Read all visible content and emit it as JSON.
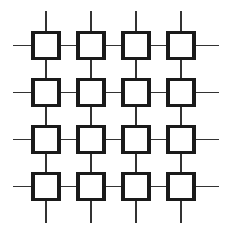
{
  "figure": {
    "canvas": {
      "width": 234,
      "height": 236,
      "background": "#ffffff"
    },
    "style": {
      "node_fill": "#ffffff",
      "node_stroke": "#1a1a1a",
      "node_stroke_width": 3.2,
      "line_stroke": "#333333",
      "line_stroke_width": 1.6
    },
    "grid": {
      "rows": 4,
      "columns": 4,
      "node_count": 16,
      "node_size": 26,
      "column_centers": [
        46,
        91,
        136,
        181
      ],
      "row_centers": [
        45.5,
        92.5,
        139.5,
        186.5
      ],
      "column_pitch": 45,
      "row_pitch": 47
    },
    "stubs": {
      "left_x": 13,
      "right_x": 219,
      "top_y": 11,
      "bottom_y": 223
    },
    "nodes": [
      {
        "id": "node-r1c1",
        "row": 1,
        "col": 1,
        "cx": 46,
        "cy": 45.5
      },
      {
        "id": "node-r1c2",
        "row": 1,
        "col": 2,
        "cx": 91,
        "cy": 45.5
      },
      {
        "id": "node-r1c3",
        "row": 1,
        "col": 3,
        "cx": 136,
        "cy": 45.5
      },
      {
        "id": "node-r1c4",
        "row": 1,
        "col": 4,
        "cx": 181,
        "cy": 45.5
      },
      {
        "id": "node-r2c1",
        "row": 2,
        "col": 1,
        "cx": 46,
        "cy": 92.5
      },
      {
        "id": "node-r2c2",
        "row": 2,
        "col": 2,
        "cx": 91,
        "cy": 92.5
      },
      {
        "id": "node-r2c3",
        "row": 2,
        "col": 3,
        "cx": 136,
        "cy": 92.5
      },
      {
        "id": "node-r2c4",
        "row": 2,
        "col": 4,
        "cx": 181,
        "cy": 92.5
      },
      {
        "id": "node-r3c1",
        "row": 3,
        "col": 1,
        "cx": 46,
        "cy": 139.5
      },
      {
        "id": "node-r3c2",
        "row": 3,
        "col": 2,
        "cx": 91,
        "cy": 139.5
      },
      {
        "id": "node-r3c3",
        "row": 3,
        "col": 3,
        "cx": 136,
        "cy": 139.5
      },
      {
        "id": "node-r3c4",
        "row": 3,
        "col": 4,
        "cx": 181,
        "cy": 139.5
      },
      {
        "id": "node-r4c1",
        "row": 4,
        "col": 1,
        "cx": 46,
        "cy": 186.5
      },
      {
        "id": "node-r4c2",
        "row": 4,
        "col": 2,
        "cx": 91,
        "cy": 186.5
      },
      {
        "id": "node-r4c3",
        "row": 4,
        "col": 3,
        "cx": 136,
        "cy": 186.5
      },
      {
        "id": "node-r4c4",
        "row": 4,
        "col": 4,
        "cx": 181,
        "cy": 186.5
      }
    ],
    "labels": []
  }
}
